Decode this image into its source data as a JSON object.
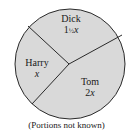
{
  "diagram": {
    "type": "pie-partition",
    "fill_color": "#d9d9d9",
    "line_color": "#2a2a2a",
    "sectors": [
      {
        "name": "Dick",
        "share": "1½ x",
        "whole": "1",
        "frac": "½",
        "var": "x"
      },
      {
        "name": "Harry",
        "share": "x",
        "var": "x"
      },
      {
        "name": "Tom",
        "share": "2x",
        "coef": "2",
        "var": "x"
      }
    ],
    "caption": "(Portions not known)"
  }
}
